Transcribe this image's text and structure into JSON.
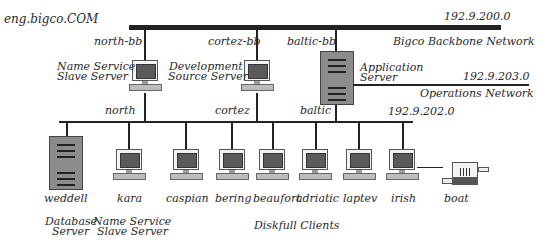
{
  "domain_title": "eng.bigco.COM",
  "networks": {
    "backbone": {
      "address": "192.9.200.0",
      "name": "Bigco Backbone Network"
    },
    "operations": {
      "address": "192.9.203.0",
      "name": "Operations Network"
    },
    "local": {
      "address": "192.9.202.0"
    }
  },
  "backbone_hosts": [
    {
      "bb_name": "north-bb",
      "role_line1": "Name Service",
      "role_line2": "Slave Server",
      "lan_name": "north"
    },
    {
      "bb_name": "cortez-bb",
      "role_line1": "Development",
      "role_line2": "Source Server",
      "lan_name": "cortez"
    },
    {
      "bb_name": "baltic-bb",
      "role_line1": "Application",
      "role_line2": "Server",
      "lan_name": "baltic"
    }
  ],
  "lan_hosts": [
    {
      "name": "weddell",
      "type": "tower"
    },
    {
      "name": "kara",
      "type": "workstation"
    },
    {
      "name": "caspian",
      "type": "workstation"
    },
    {
      "name": "bering",
      "type": "workstation"
    },
    {
      "name": "beaufort",
      "type": "workstation"
    },
    {
      "name": "adriatic",
      "type": "workstation"
    },
    {
      "name": "laptev",
      "type": "workstation"
    },
    {
      "name": "irish",
      "type": "workstation"
    },
    {
      "name": "boat",
      "type": "modem"
    }
  ],
  "group_labels": {
    "database_l1": "Database",
    "database_l2": "Server",
    "nss_l1": "Name Service",
    "nss_l2": "Slave Server",
    "clients": "Diskfull Clients"
  },
  "colors": {
    "line": "#222222",
    "screen": "#5a5a5a",
    "tower": "#8c8c8c"
  }
}
